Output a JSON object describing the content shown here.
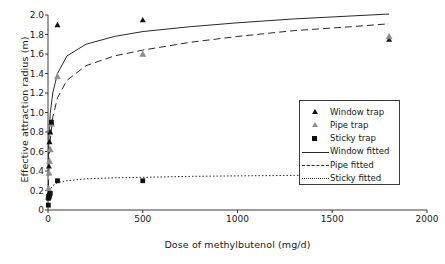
{
  "chart_data": {
    "type": "scatter",
    "title": "",
    "xlabel": "Dose of methylbutenol (mg/d)",
    "ylabel": "Effective attraction radius (m)",
    "xlim": [
      0,
      2000
    ],
    "ylim": [
      0,
      2.0
    ],
    "xticks": [
      "0",
      "500",
      "1000",
      "1500",
      "2000"
    ],
    "xtick_values": [
      0,
      500,
      1000,
      1500,
      2000
    ],
    "yticks": [
      "0",
      "0.2",
      "0.4",
      "0.6",
      "0.8",
      "1.0",
      "1.2",
      "1.4",
      "1.6",
      "1.8",
      "2.0"
    ],
    "ytick_values": [
      0,
      0.2,
      0.4,
      0.6,
      0.8,
      1.0,
      1.2,
      1.4,
      1.6,
      1.8,
      2.0
    ],
    "grid": false,
    "legend_position": "center-right",
    "series": [
      {
        "name": "Window trap",
        "kind": "scatter",
        "marker": "triangle",
        "color": "#111111",
        "points": [
          {
            "x": 2,
            "y": 0.13
          },
          {
            "x": 3,
            "y": 0.17
          },
          {
            "x": 5,
            "y": 0.45
          },
          {
            "x": 8,
            "y": 0.7
          },
          {
            "x": 12,
            "y": 0.8
          },
          {
            "x": 18,
            "y": 0.9
          },
          {
            "x": 50,
            "y": 1.9
          },
          {
            "x": 500,
            "y": 1.95
          },
          {
            "x": 1800,
            "y": 1.75
          }
        ]
      },
      {
        "name": "Pipe trap",
        "kind": "scatter",
        "marker": "triangle-open",
        "color": "#8d8d8d",
        "points": [
          {
            "x": 2,
            "y": 0.14
          },
          {
            "x": 3,
            "y": 0.22
          },
          {
            "x": 5,
            "y": 0.38
          },
          {
            "x": 8,
            "y": 0.5
          },
          {
            "x": 12,
            "y": 0.62
          },
          {
            "x": 18,
            "y": 0.88
          },
          {
            "x": 50,
            "y": 1.37
          },
          {
            "x": 500,
            "y": 1.6
          },
          {
            "x": 1800,
            "y": 1.78
          }
        ]
      },
      {
        "name": "Sticky trap",
        "kind": "scatter",
        "marker": "square",
        "color": "#111111",
        "points": [
          {
            "x": 2,
            "y": 0.05
          },
          {
            "x": 3,
            "y": 0.12
          },
          {
            "x": 5,
            "y": 0.14
          },
          {
            "x": 8,
            "y": 0.15
          },
          {
            "x": 12,
            "y": 0.17
          },
          {
            "x": 18,
            "y": 0.9
          },
          {
            "x": 50,
            "y": 0.3
          },
          {
            "x": 500,
            "y": 0.3
          }
        ]
      },
      {
        "name": "Window fitted",
        "kind": "line",
        "linestyle": "solid",
        "color": "#2a2a2a",
        "curve": [
          {
            "x": 2,
            "y": 0.52
          },
          {
            "x": 6,
            "y": 0.8
          },
          {
            "x": 12,
            "y": 0.99
          },
          {
            "x": 25,
            "y": 1.2
          },
          {
            "x": 50,
            "y": 1.4
          },
          {
            "x": 100,
            "y": 1.58
          },
          {
            "x": 200,
            "y": 1.7
          },
          {
            "x": 350,
            "y": 1.78
          },
          {
            "x": 500,
            "y": 1.83
          },
          {
            "x": 750,
            "y": 1.88
          },
          {
            "x": 1000,
            "y": 1.92
          },
          {
            "x": 1300,
            "y": 1.96
          },
          {
            "x": 1600,
            "y": 1.99
          },
          {
            "x": 1800,
            "y": 2.01
          }
        ]
      },
      {
        "name": "Pipe fitted",
        "kind": "line",
        "linestyle": "dashed",
        "color": "#2a2a2a",
        "curve": [
          {
            "x": 2,
            "y": 0.24
          },
          {
            "x": 6,
            "y": 0.52
          },
          {
            "x": 12,
            "y": 0.72
          },
          {
            "x": 25,
            "y": 0.95
          },
          {
            "x": 50,
            "y": 1.15
          },
          {
            "x": 100,
            "y": 1.33
          },
          {
            "x": 200,
            "y": 1.48
          },
          {
            "x": 350,
            "y": 1.58
          },
          {
            "x": 500,
            "y": 1.64
          },
          {
            "x": 750,
            "y": 1.72
          },
          {
            "x": 1000,
            "y": 1.78
          },
          {
            "x": 1300,
            "y": 1.84
          },
          {
            "x": 1600,
            "y": 1.88
          },
          {
            "x": 1800,
            "y": 1.91
          }
        ]
      },
      {
        "name": "Sticky fitted",
        "kind": "line",
        "linestyle": "dotted",
        "color": "#2a2a2a",
        "curve": [
          {
            "x": 2,
            "y": 0.12
          },
          {
            "x": 6,
            "y": 0.17
          },
          {
            "x": 12,
            "y": 0.21
          },
          {
            "x": 25,
            "y": 0.25
          },
          {
            "x": 50,
            "y": 0.28
          },
          {
            "x": 100,
            "y": 0.3
          },
          {
            "x": 200,
            "y": 0.32
          },
          {
            "x": 350,
            "y": 0.33
          },
          {
            "x": 500,
            "y": 0.335
          },
          {
            "x": 750,
            "y": 0.345
          },
          {
            "x": 1000,
            "y": 0.35
          },
          {
            "x": 1300,
            "y": 0.355
          },
          {
            "x": 1600,
            "y": 0.36
          },
          {
            "x": 1800,
            "y": 0.365
          }
        ]
      }
    ],
    "legend": [
      {
        "label": "Window trap",
        "key": "triangle-dark"
      },
      {
        "label": "Pipe trap",
        "key": "triangle-light"
      },
      {
        "label": "Sticky trap",
        "key": "square-dark"
      },
      {
        "label": "Window fitted",
        "key": "line-solid"
      },
      {
        "label": "Pipe fitted",
        "key": "line-dashed"
      },
      {
        "label": "Sticky fitted",
        "key": "line-dotted"
      }
    ]
  },
  "colors": {
    "axis": "#3a3a3a",
    "marker_dark": "#111111",
    "marker_light": "#8d8d8d",
    "line": "#2a2a2a",
    "background": "#ffffff"
  }
}
